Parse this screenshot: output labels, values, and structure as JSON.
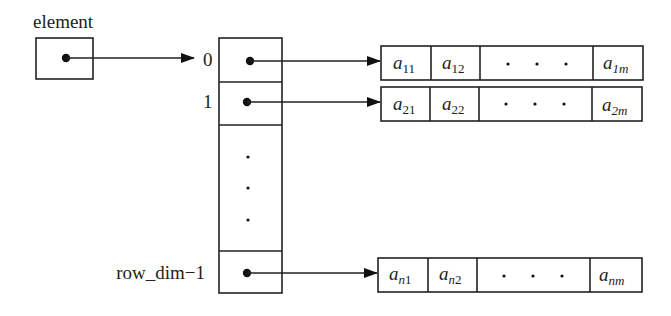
{
  "diagram": {
    "title": "",
    "pointer_label": "element",
    "index_labels": [
      "0",
      "1",
      "row_dim−1"
    ],
    "rows": [
      {
        "index": "0",
        "cells": [
          {
            "base": "a",
            "sub": "11"
          },
          {
            "base": "a",
            "sub": "12"
          },
          {
            "ellipsis": "•    •    •"
          },
          {
            "base": "a",
            "sub": "1m"
          }
        ]
      },
      {
        "index": "1",
        "cells": [
          {
            "base": "a",
            "sub": "21"
          },
          {
            "base": "a",
            "sub": "22"
          },
          {
            "ellipsis": "•    •    •"
          },
          {
            "base": "a",
            "sub": "2m"
          }
        ]
      },
      {
        "index": "row_dim−1",
        "cells": [
          {
            "base": "a",
            "sub": "n1"
          },
          {
            "base": "a",
            "sub": "n2"
          },
          {
            "ellipsis": "•    •    •"
          },
          {
            "base": "a",
            "sub": "nm"
          }
        ]
      }
    ],
    "vertical_ellipsis": "⋮",
    "colors": {
      "stroke": "#222222",
      "background": "#ffffff"
    }
  }
}
